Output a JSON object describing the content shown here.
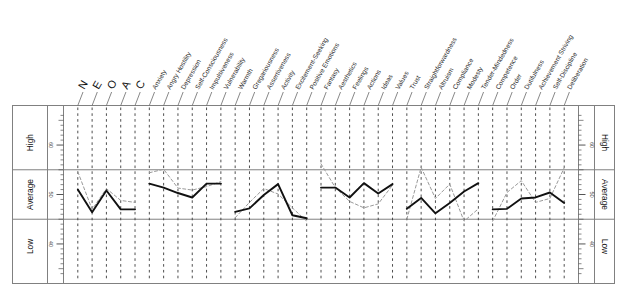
{
  "chart_data": {
    "type": "line",
    "title": "",
    "xlabel": "",
    "ylabel": "T-score",
    "ylim": [
      32,
      68
    ],
    "grid": true,
    "legend": "none",
    "y_ticks": [
      40,
      50,
      60
    ],
    "y_tick_labels": [
      "40",
      "50",
      "60"
    ],
    "band_labels": [
      "High",
      "Average",
      "Low"
    ],
    "band_bounds": [
      55,
      45
    ],
    "domain_labels": [
      "N",
      "E",
      "O",
      "A",
      "C"
    ],
    "categories": [
      "N",
      "E",
      "O",
      "A",
      "C",
      "Anxiety",
      "Angry Hostility",
      "Depression",
      "Self-Consciousness",
      "Impulsiveness",
      "Vulnerability",
      "Warmth",
      "Gregariousness",
      "Assertiveness",
      "Activity",
      "Excitement-Seeking",
      "Positive Emotions",
      "Fantasy",
      "Aesthetics",
      "Feelings",
      "Actions",
      "Ideas",
      "Values",
      "Trust",
      "Straightforwardness",
      "Altruism",
      "Compliance",
      "Modesty",
      "Tender-Mindedness",
      "Competence",
      "Order",
      "Dutifulness",
      "Achievement Striving",
      "Self-Discipline",
      "Deliberation"
    ],
    "series": [
      {
        "name": "primary",
        "style": "solid",
        "color": "#111111",
        "segments": [
          {
            "name": "domains",
            "x": [
              0,
              1,
              2,
              3,
              4
            ],
            "values": [
              51.0,
              46.4,
              50.8,
              47.0,
              47.0
            ]
          },
          {
            "name": "neuroticism-facets",
            "x": [
              5,
              6,
              7,
              8,
              9,
              10
            ],
            "values": [
              52.2,
              51.4,
              50.3,
              49.4,
              52.2,
              52.2
            ]
          },
          {
            "name": "extraversion-facets",
            "x": [
              11,
              12,
              13,
              14,
              15,
              16
            ],
            "values": [
              46.5,
              47.2,
              49.9,
              52.1,
              45.8,
              45.2
            ]
          },
          {
            "name": "openness-facets",
            "x": [
              17,
              18,
              19,
              20,
              21,
              22
            ],
            "values": [
              51.4,
              51.4,
              49.4,
              52.3,
              50.2,
              52.1
            ]
          },
          {
            "name": "agreeableness-facets",
            "x": [
              23,
              24,
              25,
              26,
              27,
              28
            ],
            "values": [
              47.1,
              49.3,
              46.2,
              48.3,
              50.6,
              52.3
            ]
          },
          {
            "name": "conscientiousness-facets",
            "x": [
              29,
              30,
              31,
              32,
              33,
              34
            ],
            "values": [
              47.0,
              47.1,
              49.2,
              49.4,
              50.4,
              48.3
            ]
          }
        ]
      },
      {
        "name": "secondary",
        "style": "dashed",
        "color": "#9a9a9a",
        "segments": [
          {
            "name": "domains",
            "x": [
              0,
              1,
              2,
              3,
              4
            ],
            "values": [
              54.6,
              47.0,
              51.2,
              48.8,
              48.4
            ]
          },
          {
            "name": "neuroticism-facets",
            "x": [
              5,
              6,
              7,
              8,
              9,
              10
            ],
            "values": [
              54.4,
              55.1,
              51.3,
              50.9,
              51.6,
              52.6
            ]
          },
          {
            "name": "extraversion-facets",
            "x": [
              11,
              12,
              13,
              14,
              15,
              16
            ],
            "values": [
              45.3,
              48.4,
              51.2,
              50.1,
              47.3,
              44.6
            ]
          },
          {
            "name": "openness-facets",
            "x": [
              17,
              18,
              19,
              20,
              21,
              22
            ],
            "values": [
              56.2,
              51.4,
              48.6,
              47.3,
              48.1,
              51.9
            ]
          },
          {
            "name": "agreeableness-facets",
            "x": [
              23,
              24,
              25,
              26,
              27,
              28
            ],
            "values": [
              45.0,
              55.5,
              49.2,
              52.1,
              44.6,
              47.1
            ]
          },
          {
            "name": "conscientiousness-facets",
            "x": [
              29,
              30,
              31,
              32,
              33,
              34
            ],
            "values": [
              44.6,
              50.4,
              52.8,
              48.4,
              49.2,
              55.4
            ]
          }
        ]
      }
    ]
  },
  "axis": {
    "left": {
      "bands": [
        "High",
        "Average",
        "Low"
      ],
      "numbers": [
        "60",
        "50",
        "40"
      ]
    },
    "right": {
      "bands": [
        "High",
        "Average",
        "Low"
      ],
      "numbers": [
        "60",
        "50",
        "40"
      ]
    }
  }
}
